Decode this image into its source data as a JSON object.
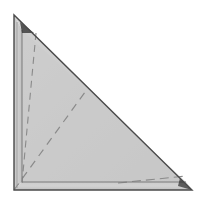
{
  "view": {
    "title": "Right Triangle Plate — Isometric Line Drawing",
    "width": 212,
    "height": 207,
    "background_color": "#ffffff"
  },
  "colors": {
    "face_fill": "#c9c9c9",
    "face_fill_light": "#d0d0d0",
    "flange_fill": "#c2c2c2",
    "outline_stroke": "#4a4a4a",
    "inner_stroke": "#7a7a7a",
    "hidden_line_stroke": "#8a8a8a",
    "shadow_dark": "#2b2b2b",
    "highlight": "#e2e2e2"
  },
  "geometry": {
    "outer_triangle": {
      "name": "outer-triangle-outline",
      "points": "14,15 14,190 192,190",
      "vertices": [
        {
          "label": "apex-top-left",
          "x": 14,
          "y": 15
        },
        {
          "label": "corner-bottom-left",
          "x": 14,
          "y": 190
        },
        {
          "label": "corner-bottom-right",
          "x": 192,
          "y": 190
        }
      ],
      "stroke_width": 1.4
    },
    "inner_offset_outline": {
      "name": "inner-offset-outline",
      "points": "22,30 22,182 186,182",
      "stroke_width": 1.0
    },
    "left_flange_band": {
      "name": "left-flange-band",
      "points": "14,15 22,30 22,182 14,190"
    },
    "bottom_flange_band": {
      "name": "bottom-flange-band",
      "points": "14,190 22,182 186,182 192,190"
    },
    "main_face": {
      "name": "main-face-panel",
      "points": "22,30 186,182 22,182"
    },
    "upper_face": {
      "name": "upper-face-panel",
      "points": "14,15 192,190 22,182 22,30"
    },
    "hidden_lines": [
      {
        "name": "hidden-line-vertical-fold",
        "x1": 36,
        "y1": 33,
        "x2": 22,
        "y2": 183,
        "dash": "7 5"
      },
      {
        "name": "hidden-line-diagonal-fold",
        "x1": 14,
        "y1": 190,
        "x2": 88,
        "y2": 88,
        "dash": "8 6"
      },
      {
        "name": "hidden-line-bottom-right-edge",
        "x1": 118,
        "y1": 183,
        "x2": 186,
        "y2": 176,
        "dash": "9 5"
      }
    ],
    "shadow_marks": [
      {
        "name": "apex-shadow-notch",
        "points": "20,22 34,33 22,33",
        "opacity": 0.75
      },
      {
        "name": "bottom-right-shadow-notch",
        "points": "180,178 192,190 178,186",
        "opacity": 0.7
      }
    ],
    "highlight_edges": [
      {
        "name": "left-edge-highlight",
        "x1": 17,
        "y1": 22,
        "x2": 17,
        "y2": 188
      },
      {
        "name": "hypotenuse-edge",
        "x1": 14,
        "y1": 15,
        "x2": 192,
        "y2": 190
      }
    ]
  },
  "labels": {
    "figure_caption": "",
    "dimension_text": ""
  }
}
